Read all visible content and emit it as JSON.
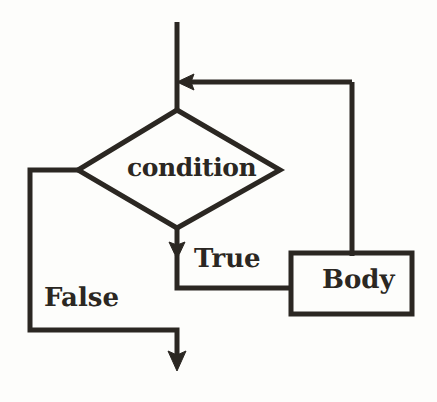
{
  "diagram": {
    "type": "flowchart",
    "stroke_color": "#2b2722",
    "background_color": "#fdfdfb",
    "nodes": {
      "decision": {
        "shape": "diamond",
        "label": "condition"
      },
      "process": {
        "shape": "rectangle",
        "label": "Body"
      }
    },
    "edges": {
      "true_label": "True",
      "false_label": "False"
    }
  }
}
